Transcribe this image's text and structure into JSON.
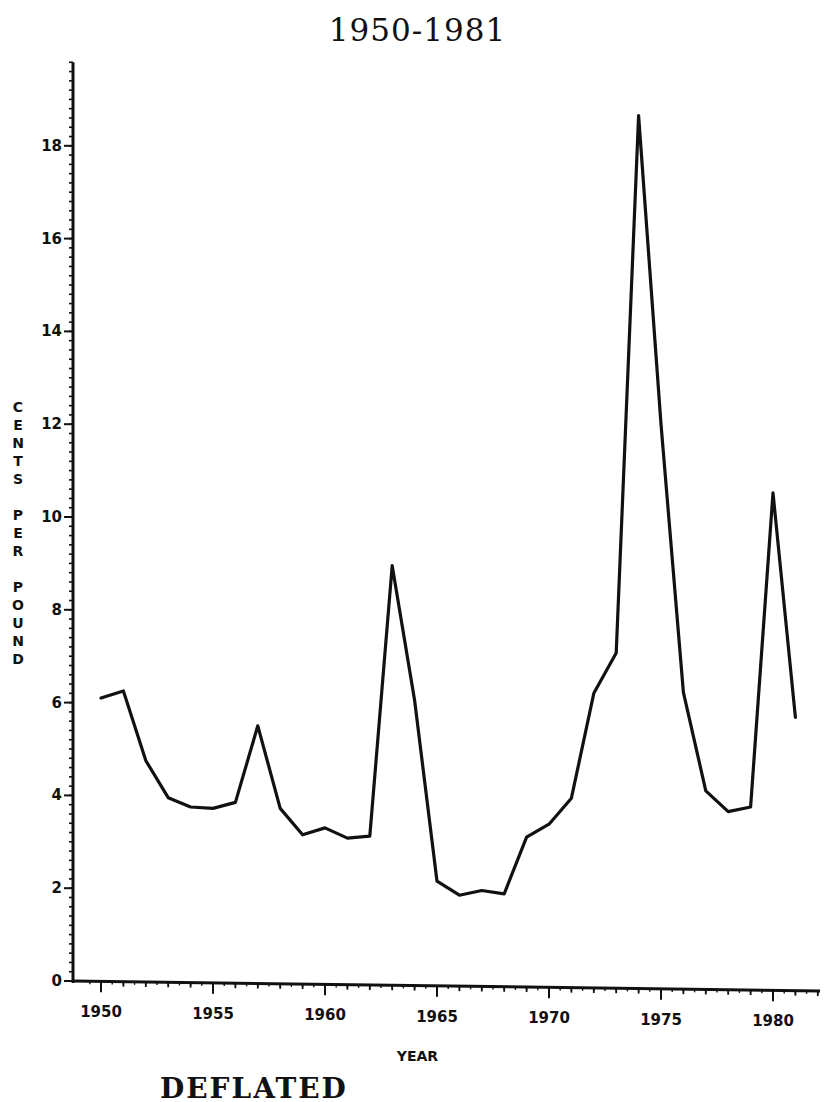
{
  "chart_data": {
    "type": "line",
    "title": "1950-1981",
    "xlabel": "YEAR",
    "ylabel": "CENTS PER POUND",
    "caption_partial": "DEFLATED",
    "x": [
      1950,
      1951,
      1952,
      1953,
      1954,
      1955,
      1956,
      1957,
      1958,
      1959,
      1960,
      1961,
      1962,
      1963,
      1964,
      1965,
      1966,
      1967,
      1968,
      1969,
      1970,
      1971,
      1972,
      1973,
      1974,
      1975,
      1976,
      1977,
      1978,
      1979,
      1980,
      1981
    ],
    "series": [
      {
        "name": "Cents per pound (deflated)",
        "values": [
          6.1,
          6.25,
          4.75,
          3.95,
          3.75,
          3.72,
          3.85,
          5.5,
          3.72,
          3.15,
          3.3,
          3.08,
          3.12,
          8.95,
          6.05,
          2.15,
          1.85,
          1.95,
          1.88,
          3.1,
          3.38,
          3.94,
          6.2,
          7.07,
          18.65,
          12.0,
          6.22,
          4.1,
          3.65,
          3.75,
          10.52,
          5.68
        ],
        "color": "#111111"
      }
    ],
    "x_ticks": [
      1950,
      1955,
      1960,
      1965,
      1970,
      1975,
      1980
    ],
    "y_ticks": [
      0,
      2,
      4,
      6,
      8,
      10,
      12,
      14,
      16,
      18
    ],
    "xlim": [
      1949.5,
      1982.1
    ],
    "ylim": [
      0,
      19.8
    ],
    "grid": false,
    "legend": "none",
    "minor_ticks": {
      "x_step": 1,
      "y_step": 0.2
    }
  }
}
